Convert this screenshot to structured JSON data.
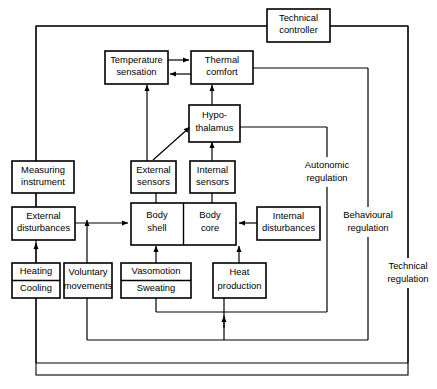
{
  "diagram": {
    "colors": {
      "stroke": "#000000",
      "background": "#ffffff"
    },
    "boxes": {
      "technical_controller": {
        "line1": "Technical",
        "line2": "controller"
      },
      "temperature_sensation": {
        "line1": "Temperature",
        "line2": "sensation"
      },
      "thermal_comfort": {
        "line1": "Thermal",
        "line2": "comfort"
      },
      "hypothalamus": {
        "line1": "Hypo-",
        "line2": "thalamus"
      },
      "measuring_instrument": {
        "line1": "Measuring",
        "line2": "instrument"
      },
      "external_sensors": {
        "line1": "External",
        "line2": "sensors"
      },
      "internal_sensors": {
        "line1": "Internal",
        "line2": "sensors"
      },
      "external_disturbances": {
        "line1": "External",
        "line2": "disturbances"
      },
      "body_shell": {
        "line1": "Body",
        "line2": "shell"
      },
      "body_core": {
        "line1": "Body",
        "line2": "core"
      },
      "internal_disturbances": {
        "line1": "Internal",
        "line2": "disturbances"
      },
      "heating_cooling": {
        "line1": "Heating",
        "line2": "Cooling"
      },
      "voluntary_movements": {
        "line1": "Voluntary",
        "line2": "movements"
      },
      "vasomotion_sweating": {
        "line1": "Vasomotion",
        "line2": "Sweating"
      },
      "heat_production": {
        "line1": "Heat",
        "line2": "production"
      }
    },
    "side_labels": {
      "autonomic_regulation": {
        "line1": "Autonomic",
        "line2": "regulation"
      },
      "behavioural_regulation": {
        "line1": "Behavioural",
        "line2": "regulation"
      },
      "technical_regulation": {
        "line1": "Technical",
        "line2": "regulation"
      }
    }
  }
}
